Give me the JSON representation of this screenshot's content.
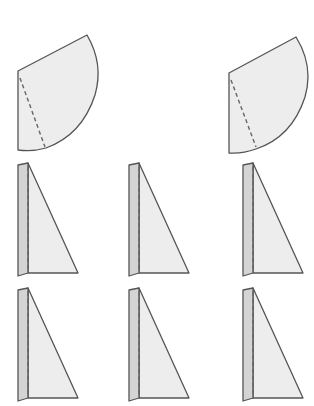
{
  "diagram": {
    "colors": {
      "fill_light": "#ededed",
      "fill_flap": "#d4d4d4",
      "stroke": "#555555",
      "dash": "#666666",
      "background": "#ffffff"
    },
    "sectors": [
      {
        "id": "sector-1",
        "left_x": 18,
        "top_y": 71,
        "bottom_y": 150,
        "apex": [
          87,
          35
        ],
        "arc_end": [
          46,
          148
        ],
        "fold_line": [
          [
            20,
            78
          ],
          [
            45,
            147
          ]
        ]
      },
      {
        "id": "sector-2",
        "left_x": 229,
        "top_y": 73,
        "bottom_y": 153,
        "apex": [
          296,
          37
        ],
        "arc_end": [
          256,
          148
        ],
        "fold_line": [
          [
            231,
            80
          ],
          [
            256,
            147
          ]
        ]
      }
    ],
    "triangles": [
      {
        "id": "triangle-r1-c1",
        "x": 18,
        "y": 163
      },
      {
        "id": "triangle-r1-c2",
        "x": 129,
        "y": 163
      },
      {
        "id": "triangle-r1-c3",
        "x": 243,
        "y": 163
      },
      {
        "id": "triangle-r2-c1",
        "x": 18,
        "y": 288
      },
      {
        "id": "triangle-r2-c2",
        "x": 129,
        "y": 288
      },
      {
        "id": "triangle-r2-c3",
        "x": 243,
        "y": 288
      }
    ]
  }
}
